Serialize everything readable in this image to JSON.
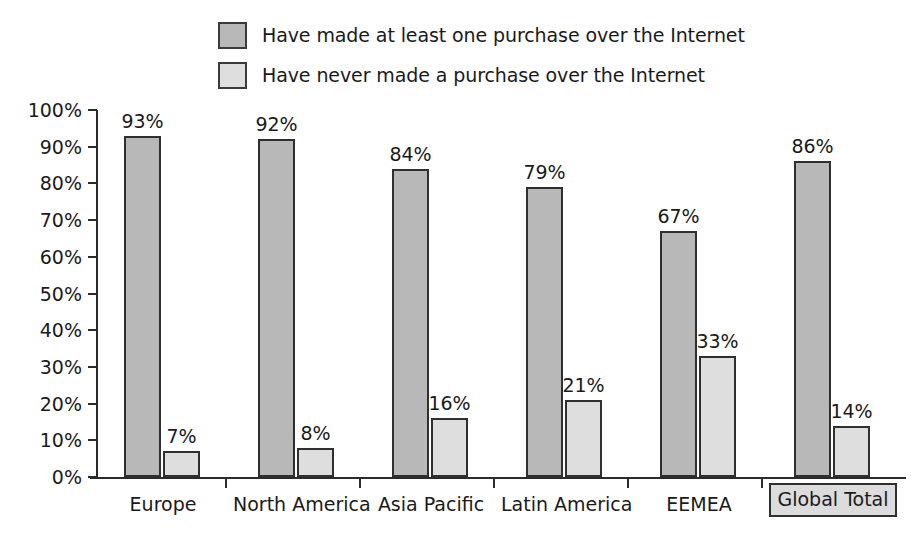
{
  "chart_data": {
    "type": "bar",
    "title": "",
    "xlabel": "",
    "ylabel": "",
    "ylim": [
      0,
      100
    ],
    "ytick_labels": [
      "100%",
      "90%",
      "80%",
      "70%",
      "60%",
      "50%",
      "40%",
      "30%",
      "20%",
      "10%",
      "0%"
    ],
    "ytick_values": [
      100,
      90,
      80,
      70,
      60,
      50,
      40,
      30,
      20,
      10,
      0
    ],
    "grid": false,
    "legend_position": "top-center",
    "categories": [
      "Europe",
      "North America",
      "Asia Pacific",
      "Latin America",
      "EEMEA",
      "Global Total"
    ],
    "highlighted_category": "Global Total",
    "series": [
      {
        "name": "Have made at least one purchase over the Internet",
        "color": "#b8b8b8",
        "values": [
          93,
          92,
          84,
          79,
          67,
          86
        ],
        "labels": [
          "93%",
          "92%",
          "84%",
          "79%",
          "67%",
          "86%"
        ]
      },
      {
        "name": "Have never made a purchase over the Internet",
        "color": "#dedede",
        "values": [
          7,
          8,
          16,
          21,
          33,
          14
        ],
        "labels": [
          "7%",
          "8%",
          "16%",
          "21%",
          "33%",
          "14%"
        ]
      }
    ]
  },
  "legend": {
    "items": [
      {
        "label": "Have made at least one purchase over the Internet",
        "swatch": "#b8b8b8"
      },
      {
        "label": "Have never made a purchase over the Internet",
        "swatch": "#dedede"
      }
    ]
  },
  "colors": {
    "series_dark": "#b8b8b8",
    "series_light": "#dedede",
    "axis": "#2b2b2b",
    "border": "#2f2f2f",
    "text": "#1a1a1a",
    "background": "#ffffff"
  }
}
